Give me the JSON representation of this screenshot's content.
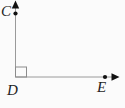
{
  "figure": {
    "labels": {
      "C": "C",
      "D": "D",
      "E": "E"
    },
    "vertex": "D",
    "rays": [
      "DC",
      "DE"
    ],
    "right_angle_at": "D",
    "points_marked_with_dots": [
      "C",
      "E"
    ],
    "colors": {
      "background": "#fbfbfb",
      "ray": "#9a9a9a",
      "right_angle_marker": "#8c8c8c",
      "point_dot": "#111111",
      "arrowhead": "#111111",
      "label": "#1f1f1f"
    }
  }
}
